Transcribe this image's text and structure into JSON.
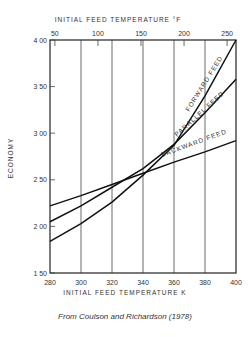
{
  "chart_data": {
    "type": "line",
    "title": "",
    "xlabel": "INITIAL FEED TEMPERATURE   K",
    "x2label": "INITIAL FEED TEMPERATURE   °F",
    "ylabel": "ECONOMY",
    "xlim": [
      280,
      400
    ],
    "ylim": [
      1.5,
      4.0
    ],
    "x_ticks": [
      280,
      300,
      320,
      340,
      360,
      380,
      400
    ],
    "x2_ticks": [
      50,
      100,
      150,
      200,
      250
    ],
    "y_ticks": [
      "1.50",
      "2.00",
      "2.50",
      "3.00",
      "3.50",
      "4.00"
    ],
    "grid": "vertical lines at 300,320,340,360,380 K",
    "series": [
      {
        "name": "FORWARD FEED",
        "x": [
          280,
          300,
          320,
          340,
          360,
          380,
          400
        ],
        "values": [
          1.84,
          2.03,
          2.26,
          2.55,
          2.87,
          3.4,
          4.0
        ]
      },
      {
        "name": "PARALLEL FEED",
        "x": [
          280,
          300,
          320,
          340,
          360,
          380,
          400
        ],
        "values": [
          2.05,
          2.22,
          2.42,
          2.62,
          2.88,
          3.22,
          3.58
        ]
      },
      {
        "name": "BACKWARD FEED",
        "x": [
          280,
          300,
          320,
          340,
          360,
          380,
          400
        ],
        "values": [
          2.22,
          2.33,
          2.45,
          2.57,
          2.69,
          2.8,
          2.92
        ]
      }
    ]
  },
  "caption": "From Coulson and Richardson (1978)"
}
